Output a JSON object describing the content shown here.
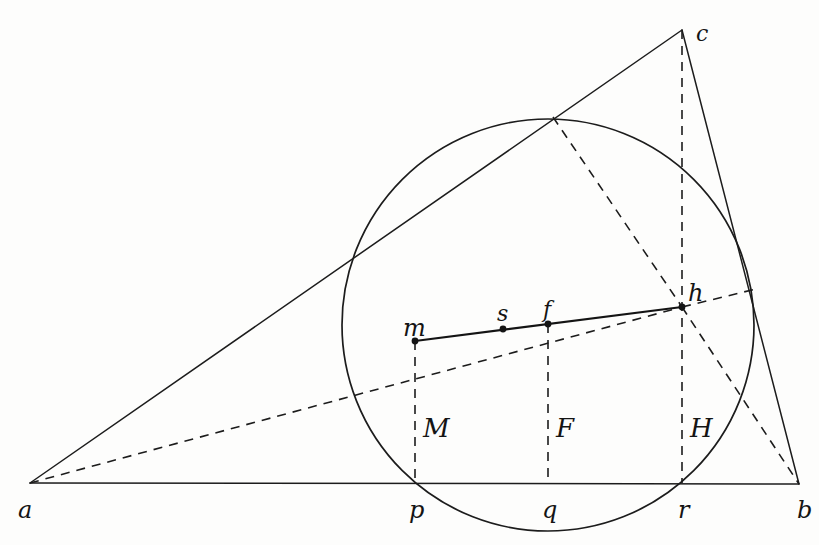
{
  "figure": {
    "background_color": "#fdfdfc",
    "ink_color": "#141414",
    "width": 819,
    "height": 545
  },
  "labels": {
    "a": "a",
    "b": "b",
    "c": "c",
    "p": "p",
    "q": "q",
    "r": "r",
    "m": "m",
    "s": "s",
    "f": "f",
    "h": "h",
    "M": "M",
    "F": "F",
    "H": "H"
  },
  "chart_data": {
    "type": "scatter",
    "xlabel": "",
    "ylabel": "",
    "xlim": [
      0,
      819
    ],
    "ylim": [
      545,
      0
    ],
    "grid": false,
    "legend": "none",
    "points": [
      {
        "name": "a",
        "x": 30,
        "y": 483,
        "label": "a",
        "label_x": 18,
        "label_y": 498,
        "dot": false
      },
      {
        "name": "b",
        "x": 799,
        "y": 484,
        "label": "b",
        "label_x": 797,
        "label_y": 498,
        "dot": false
      },
      {
        "name": "c",
        "x": 682,
        "y": 30,
        "label": "c",
        "label_x": 696,
        "label_y": 23,
        "dot": false
      },
      {
        "name": "p",
        "x": 415,
        "y": 483,
        "label": "p",
        "label_x": 409,
        "label_y": 498,
        "dot": false
      },
      {
        "name": "q",
        "x": 548,
        "y": 483,
        "label": "q",
        "label_x": 542,
        "label_y": 498,
        "dot": false
      },
      {
        "name": "r",
        "x": 682,
        "y": 483,
        "label": "r",
        "label_x": 678,
        "label_y": 498,
        "dot": false
      },
      {
        "name": "m",
        "x": 415,
        "y": 341,
        "label": "m",
        "label_x": 403,
        "label_y": 316,
        "dot": true
      },
      {
        "name": "s",
        "x": 503,
        "y": 329,
        "label": "s",
        "label_x": 497,
        "label_y": 303,
        "dot": true
      },
      {
        "name": "f",
        "x": 548,
        "y": 324,
        "label": "f",
        "label_x": 543,
        "label_y": 299,
        "dot": true
      },
      {
        "name": "h",
        "x": 682,
        "y": 307,
        "label": "h",
        "label_x": 688,
        "label_y": 281,
        "dot": true
      },
      {
        "name": "M",
        "x": 415,
        "y": 428,
        "label": "M",
        "label_x": 423,
        "label_y": 415,
        "dot": false
      },
      {
        "name": "F",
        "x": 548,
        "y": 428,
        "label": "F",
        "label_x": 556,
        "label_y": 415,
        "dot": false
      },
      {
        "name": "H",
        "x": 682,
        "y": 428,
        "label": "H",
        "label_x": 690,
        "label_y": 415,
        "dot": false
      }
    ],
    "circle": {
      "cx": 548,
      "cy": 325,
      "r": 206
    },
    "solid_segments": [
      {
        "name": "base-ab",
        "from": "a",
        "to": "b",
        "x1": 30,
        "y1": 483,
        "x2": 799,
        "y2": 484
      },
      {
        "name": "side-ac",
        "from": "a",
        "to": "c",
        "x1": 30,
        "y1": 483,
        "x2": 682,
        "y2": 30
      },
      {
        "name": "side-cb",
        "from": "c",
        "to": "b",
        "x1": 682,
        "y1": 30,
        "x2": 799,
        "y2": 484
      },
      {
        "name": "chord-mh",
        "from": "m",
        "to": "h",
        "x1": 415,
        "y1": 341,
        "x2": 682,
        "y2": 307
      }
    ],
    "dashed_segments": [
      {
        "name": "a-to-h",
        "x1": 30,
        "y1": 483,
        "x2": 682,
        "y2": 307
      },
      {
        "name": "h-to-b",
        "x1": 682,
        "y1": 307,
        "x2": 799,
        "y2": 484
      },
      {
        "name": "circletop-to-h",
        "x1": 553,
        "y1": 117,
        "x2": 682,
        "y2": 307
      },
      {
        "name": "h-to-circle-right",
        "x1": 682,
        "y1": 307,
        "x2": 756,
        "y2": 289
      },
      {
        "name": "vertical-m-p",
        "x1": 415,
        "y1": 341,
        "x2": 415,
        "y2": 483
      },
      {
        "name": "vertical-f-q",
        "x1": 548,
        "y1": 324,
        "x2": 548,
        "y2": 483
      },
      {
        "name": "vertical-c-r",
        "x1": 682,
        "y1": 30,
        "x2": 682,
        "y2": 483
      }
    ]
  }
}
